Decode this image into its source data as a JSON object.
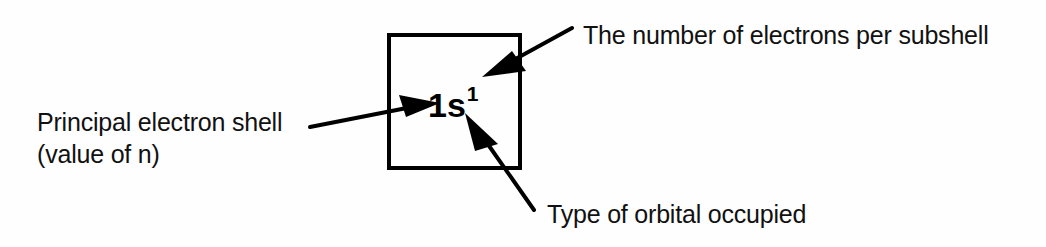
{
  "figure": {
    "background_color": "#fefefe",
    "ink_color": "#000000",
    "width": 1046,
    "height": 247
  },
  "notation": {
    "shell_number": "1",
    "subshell_letter": "s",
    "electron_count": "1",
    "base": "1s",
    "superscript": "1",
    "full": "1s1"
  },
  "box": {
    "x": 387,
    "y": 33,
    "width": 135,
    "height": 137,
    "stroke_width": 4
  },
  "labels": {
    "principal_shell_line1": "Principal electron shell",
    "principal_shell_line2": "(value of n)",
    "electrons_per_subshell": "The number of electrons per subshell",
    "orbital_type": "Type of orbital occupied"
  },
  "callouts": [
    {
      "name": "principal-shell",
      "text": "Principal electron shell (value of n)",
      "tail_x": 310,
      "tail_y": 127,
      "tip_x": 437,
      "tip_y": 103,
      "points_to": "1"
    },
    {
      "name": "electrons-per-subshell",
      "text": "The number of electrons per subshell",
      "tail_x": 572,
      "tail_y": 28,
      "tip_x": 484,
      "tip_y": 76,
      "points_to": "superscript 1"
    },
    {
      "name": "orbital-type",
      "text": "Type of orbital occupied",
      "tail_x": 534,
      "tail_y": 210,
      "tip_x": 466,
      "tip_y": 114,
      "points_to": "s"
    }
  ]
}
